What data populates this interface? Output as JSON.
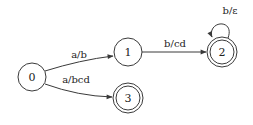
{
  "diagram": {
    "type": "finite-state-transducer",
    "colors": {
      "stroke": "#3a3a3a",
      "text": "#222222",
      "background": "#ffffff"
    },
    "states": [
      {
        "id": "0",
        "label": "0",
        "accepting": false
      },
      {
        "id": "1",
        "label": "1",
        "accepting": false
      },
      {
        "id": "2",
        "label": "2",
        "accepting": true
      },
      {
        "id": "3",
        "label": "3",
        "accepting": true
      }
    ],
    "transitions": [
      {
        "from": "0",
        "to": "1",
        "label": "a/b"
      },
      {
        "from": "0",
        "to": "3",
        "label": "a/bcd"
      },
      {
        "from": "1",
        "to": "2",
        "label": "b/cd"
      },
      {
        "from": "2",
        "to": "2",
        "label": "b/ε"
      }
    ]
  }
}
